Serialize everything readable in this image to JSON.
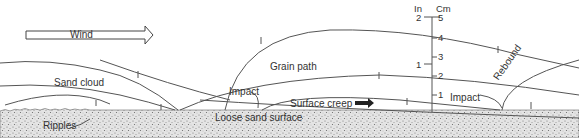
{
  "diagram": {
    "labels": {
      "wind": "Wind",
      "sand_cloud": "Sand cloud",
      "grain_path": "Grain path",
      "impact_1": "Impact",
      "impact_2": "Impact",
      "surface_creep": "Surface creep",
      "loose_sand_surface": "Loose sand surface",
      "ripples": "Ripples",
      "rebound": "Rebound"
    },
    "scale": {
      "left_unit": "In",
      "right_unit": "Cm",
      "inch_ticks": [
        "2",
        "1"
      ],
      "cm_ticks": [
        "5",
        "4",
        "3",
        "2",
        "1"
      ]
    },
    "colors": {
      "line": "#555555",
      "ground": "#d9d9d9",
      "text": "#333333",
      "background": "#ffffff"
    }
  }
}
